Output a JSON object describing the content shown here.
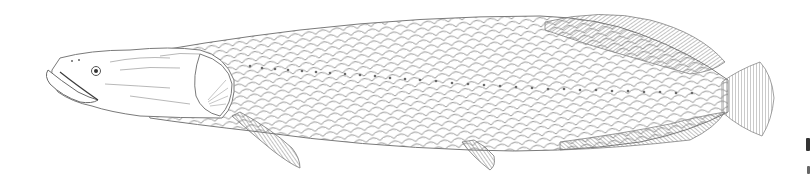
{
  "image": {
    "subject": "fish",
    "style": "pen-and-ink scientific illustration",
    "orientation": "facing left",
    "colors": {
      "background": "#ffffff",
      "ink": "#6a6a6a",
      "ink_dark": "#3c3c3c"
    }
  },
  "caption_fragment": {
    "visible": "clipped glyphs at right edge"
  }
}
